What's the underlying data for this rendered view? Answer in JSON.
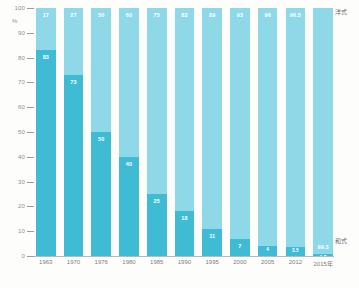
{
  "chart_data": {
    "type": "bar",
    "title": "",
    "subtitle": "",
    "xlabel": "",
    "ylabel": "%",
    "ylim": [
      0,
      100
    ],
    "grid": false,
    "stacked": true,
    "stack_total": 100,
    "legend_position": "right",
    "categories": [
      "1963",
      "1970",
      "1976",
      "1980",
      "1985",
      "1990",
      "1995",
      "2000",
      "2005",
      "2012",
      "2015年"
    ],
    "series": [
      {
        "name": "洋式",
        "color": "#8fd8e8",
        "values": [
          17,
          27,
          50,
          60,
          75,
          82,
          89,
          93,
          96,
          96.5,
          99.3
        ],
        "labels": [
          "17",
          "27",
          "50",
          "60",
          "75",
          "82",
          "89",
          "93",
          "96",
          "96.5",
          "99.3"
        ]
      },
      {
        "name": "和式",
        "color": "#3fbcd4",
        "values": [
          83,
          73,
          50,
          40,
          25,
          18,
          11,
          7,
          4,
          3.5,
          0.7
        ],
        "labels": [
          "83",
          "73",
          "50",
          "40",
          "25",
          "18",
          "11",
          "7",
          "4",
          "3.5",
          "0.7"
        ]
      }
    ],
    "yticks": [
      "100",
      "90",
      "80",
      "70",
      "60",
      "50",
      "40",
      "30",
      "20",
      "10",
      "0"
    ],
    "yunit": "%"
  },
  "legend": {
    "top_label": "洋式",
    "bottom_label": "和式"
  }
}
